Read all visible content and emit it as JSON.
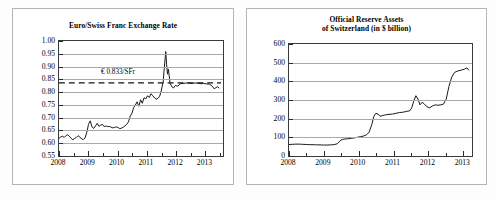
{
  "figure": {
    "background": "#fdfdfd",
    "panel_border": "#b4b4b4",
    "axis_color": "#3a3a3a",
    "grid_color": "#a9a9a9",
    "line_color": "#1a1a1a"
  },
  "panels": [
    {
      "name": "euro-swiss-franc-exchange-rate",
      "title_lines": [
        "Euro/Swiss Franc Exchange Rate"
      ]
    },
    {
      "name": "official-reserve-assets-of-switzerland",
      "title_lines": [
        "Official Reserve Assets",
        "of Switzerland (in $ billion)"
      ]
    }
  ],
  "chart_data": [
    {
      "type": "line",
      "title": "Euro/Swiss Franc Exchange Rate",
      "xlabel": "",
      "ylabel": "",
      "grid": true,
      "legend": "none",
      "xlim": [
        2008.0,
        2013.6
      ],
      "ylim": [
        0.55,
        1.0
      ],
      "ytick_labels": [
        "1.00",
        "0.95",
        "0.90",
        "0.85",
        "0.80",
        "0.75",
        "0.70",
        "0.65",
        "0.60",
        "0.55"
      ],
      "ytick_values": [
        1.0,
        0.95,
        0.9,
        0.85,
        0.8,
        0.75,
        0.7,
        0.65,
        0.6,
        0.55
      ],
      "xtick_labels": [
        "2008",
        "2009",
        "2010",
        "2011",
        "2012",
        "2013"
      ],
      "xtick_values": [
        2008,
        2009,
        2010,
        2011,
        2012,
        2013
      ],
      "minor_xticks": [
        2008.5,
        2009.5,
        2010.5,
        2011.5,
        2012.5,
        2013.5
      ],
      "annotations": [
        {
          "text": "€ 0.833/SFr",
          "x": 2010.05,
          "y": 0.8655,
          "style": "label"
        },
        {
          "text": "",
          "y": 0.833,
          "style": "dashed-reference-line"
        }
      ],
      "reference_line": {
        "value": 0.833,
        "dash": "6,4"
      },
      "series": [
        {
          "name": "EUR per CHF",
          "x": [
            2008.0,
            2008.06,
            2008.12,
            2008.18,
            2008.24,
            2008.3,
            2008.36,
            2008.42,
            2008.48,
            2008.54,
            2008.6,
            2008.66,
            2008.72,
            2008.78,
            2008.84,
            2008.9,
            2008.96,
            2009.02,
            2009.08,
            2009.14,
            2009.2,
            2009.26,
            2009.32,
            2009.38,
            2009.44,
            2009.5,
            2009.56,
            2009.62,
            2009.68,
            2009.74,
            2009.8,
            2009.86,
            2009.92,
            2009.98,
            2010.04,
            2010.1,
            2010.16,
            2010.22,
            2010.28,
            2010.34,
            2010.4,
            2010.46,
            2010.52,
            2010.58,
            2010.64,
            2010.7,
            2010.76,
            2010.82,
            2010.88,
            2010.94,
            2011.0,
            2011.06,
            2011.12,
            2011.18,
            2011.24,
            2011.3,
            2011.36,
            2011.42,
            2011.48,
            2011.54,
            2011.6,
            2011.63,
            2011.66,
            2011.69,
            2011.72,
            2011.75,
            2011.78,
            2011.84,
            2011.9,
            2011.96,
            2012.02,
            2012.1,
            2012.2,
            2012.3,
            2012.4,
            2012.5,
            2012.6,
            2012.7,
            2012.8,
            2012.9,
            2013.0,
            2013.1,
            2013.2,
            2013.3,
            2013.36,
            2013.42,
            2013.48,
            2013.54
          ],
          "y": [
            0.612,
            0.618,
            0.621,
            0.616,
            0.623,
            0.627,
            0.621,
            0.612,
            0.607,
            0.612,
            0.616,
            0.623,
            0.618,
            0.61,
            0.608,
            0.614,
            0.636,
            0.668,
            0.682,
            0.658,
            0.652,
            0.662,
            0.672,
            0.66,
            0.665,
            0.668,
            0.659,
            0.662,
            0.659,
            0.66,
            0.657,
            0.654,
            0.656,
            0.658,
            0.656,
            0.651,
            0.653,
            0.657,
            0.662,
            0.668,
            0.678,
            0.7,
            0.712,
            0.735,
            0.745,
            0.758,
            0.74,
            0.766,
            0.752,
            0.774,
            0.77,
            0.782,
            0.775,
            0.79,
            0.782,
            0.774,
            0.768,
            0.772,
            0.78,
            0.805,
            0.838,
            0.88,
            0.92,
            0.958,
            0.905,
            0.868,
            0.888,
            0.832,
            0.818,
            0.813,
            0.823,
            0.82,
            0.83,
            0.831,
            0.833,
            0.832,
            0.831,
            0.833,
            0.832,
            0.83,
            0.831,
            0.829,
            0.828,
            0.82,
            0.81,
            0.814,
            0.818,
            0.812
          ]
        }
      ]
    },
    {
      "type": "line",
      "title": "Official Reserve Assets of Switzerland (in $ billion)",
      "xlabel": "",
      "ylabel": "",
      "grid": true,
      "legend": "none",
      "xlim": [
        2008.0,
        2013.25
      ],
      "ylim": [
        0,
        600
      ],
      "ytick_labels": [
        "600",
        "500",
        "400",
        "300",
        "200",
        "100",
        "0"
      ],
      "ytick_values": [
        600,
        500,
        400,
        300,
        200,
        100,
        0
      ],
      "xtick_labels": [
        "2008",
        "2009",
        "2010",
        "2011",
        "2012",
        "2013"
      ],
      "xtick_values": [
        2008,
        2009,
        2010,
        2011,
        2012,
        2013
      ],
      "minor_xticks": [
        2008.5,
        2009.5,
        2010.5,
        2011.5,
        2012.5
      ],
      "series": [
        {
          "name": "Official reserve assets",
          "x": [
            2008.0,
            2008.1,
            2008.2,
            2008.3,
            2008.4,
            2008.5,
            2008.6,
            2008.7,
            2008.8,
            2008.9,
            2009.0,
            2009.1,
            2009.2,
            2009.3,
            2009.4,
            2009.48,
            2009.55,
            2009.62,
            2009.7,
            2009.8,
            2009.9,
            2010.0,
            2010.08,
            2010.16,
            2010.24,
            2010.32,
            2010.4,
            2010.46,
            2010.52,
            2010.58,
            2010.64,
            2010.72,
            2010.8,
            2010.9,
            2011.0,
            2011.1,
            2011.2,
            2011.3,
            2011.4,
            2011.5,
            2011.56,
            2011.62,
            2011.68,
            2011.74,
            2011.8,
            2011.86,
            2011.92,
            2012.0,
            2012.08,
            2012.16,
            2012.24,
            2012.32,
            2012.4,
            2012.48,
            2012.56,
            2012.64,
            2012.72,
            2012.8,
            2012.88,
            2013.0,
            2013.08,
            2013.16,
            2013.22
          ],
          "y": [
            52,
            53,
            54,
            54,
            53,
            52,
            51,
            51,
            50,
            50,
            49,
            49,
            50,
            51,
            56,
            72,
            80,
            82,
            83,
            86,
            88,
            92,
            95,
            98,
            104,
            118,
            160,
            205,
            222,
            218,
            206,
            210,
            214,
            216,
            218,
            222,
            226,
            228,
            232,
            236,
            252,
            290,
            318,
            300,
            268,
            282,
            274,
            258,
            252,
            262,
            268,
            266,
            268,
            272,
            300,
            370,
            420,
            445,
            452,
            458,
            462,
            470,
            456
          ]
        }
      ]
    }
  ]
}
